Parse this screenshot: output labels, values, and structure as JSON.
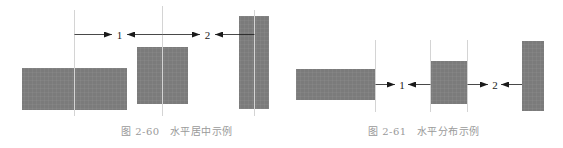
{
  "figures": [
    {
      "id": "fig-2-60",
      "caption_number": "图 2-60",
      "caption_title": "水平居中示例",
      "labels": {
        "gap1": "1",
        "gap2": "2"
      },
      "rects": [
        {
          "name": "wide-rect",
          "x": 22,
          "y": 68,
          "w": 105,
          "h": 42
        },
        {
          "name": "square-rect",
          "x": 137,
          "y": 47,
          "w": 51,
          "h": 57
        },
        {
          "name": "tall-rect",
          "x": 239,
          "y": 16,
          "w": 30,
          "h": 93
        }
      ],
      "guides": [
        74,
        162,
        254
      ],
      "arrow_y": 34
    },
    {
      "id": "fig-2-61",
      "caption_number": "图 2-61",
      "caption_title": "水平分布示例",
      "labels": {
        "gap1": "1",
        "gap2": "2"
      },
      "rects": [
        {
          "name": "wide-rect",
          "x": 296,
          "y": 69,
          "w": 79,
          "h": 31
        },
        {
          "name": "square-rect",
          "x": 430,
          "y": 61,
          "w": 37,
          "h": 43
        },
        {
          "name": "tall-rect",
          "x": 522,
          "y": 41,
          "w": 22,
          "h": 70
        }
      ],
      "guides": [
        375,
        430,
        467,
        522
      ],
      "arrow_y": 84
    }
  ],
  "colors": {
    "rect_fill": "#7b7b7b",
    "rect_grid": "#8e8e8e",
    "guide": "#d4d4d4",
    "arrow": "#1a1a1a",
    "caption": "#9a9a9a"
  }
}
